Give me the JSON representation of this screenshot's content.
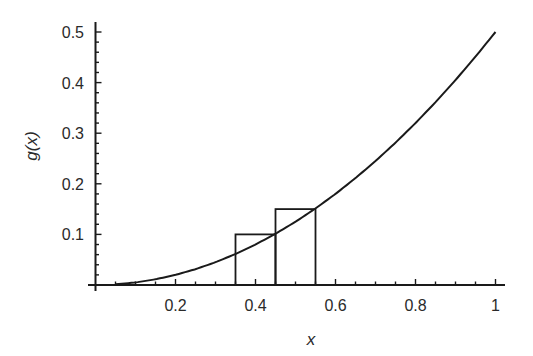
{
  "chart_data": {
    "type": "line",
    "title": "",
    "xlabel": "x",
    "ylabel": "g(x)",
    "xlim": [
      0,
      1.02
    ],
    "ylim": [
      0,
      0.52
    ],
    "grid": false,
    "legend": null,
    "x_ticks": [
      0.2,
      0.4,
      0.6,
      0.8,
      1
    ],
    "x_tick_labels": [
      "0.2",
      "0.4",
      "0.6",
      "0.8",
      "1"
    ],
    "y_ticks": [
      0.1,
      0.2,
      0.3,
      0.4,
      0.5
    ],
    "y_tick_labels": [
      "0.1",
      "0.2",
      "0.3",
      "0.4",
      "0.5"
    ],
    "series": [
      {
        "name": "g(x) = x^2/2",
        "kind": "curve",
        "x": [
          0.05,
          0.1,
          0.15,
          0.2,
          0.25,
          0.3,
          0.35,
          0.4,
          0.45,
          0.5,
          0.55,
          0.6,
          0.65,
          0.7,
          0.75,
          0.8,
          0.85,
          0.9,
          0.95,
          1.0
        ],
        "y": [
          0.00125,
          0.005,
          0.01125,
          0.02,
          0.03125,
          0.045,
          0.06125,
          0.08,
          0.10125,
          0.125,
          0.15125,
          0.18,
          0.21125,
          0.245,
          0.28125,
          0.32,
          0.36125,
          0.405,
          0.45125,
          0.5
        ]
      }
    ],
    "rectangles": [
      {
        "x0": 0.35,
        "x1": 0.45,
        "height": 0.1
      },
      {
        "x0": 0.45,
        "x1": 0.55,
        "height": 0.15
      }
    ]
  }
}
